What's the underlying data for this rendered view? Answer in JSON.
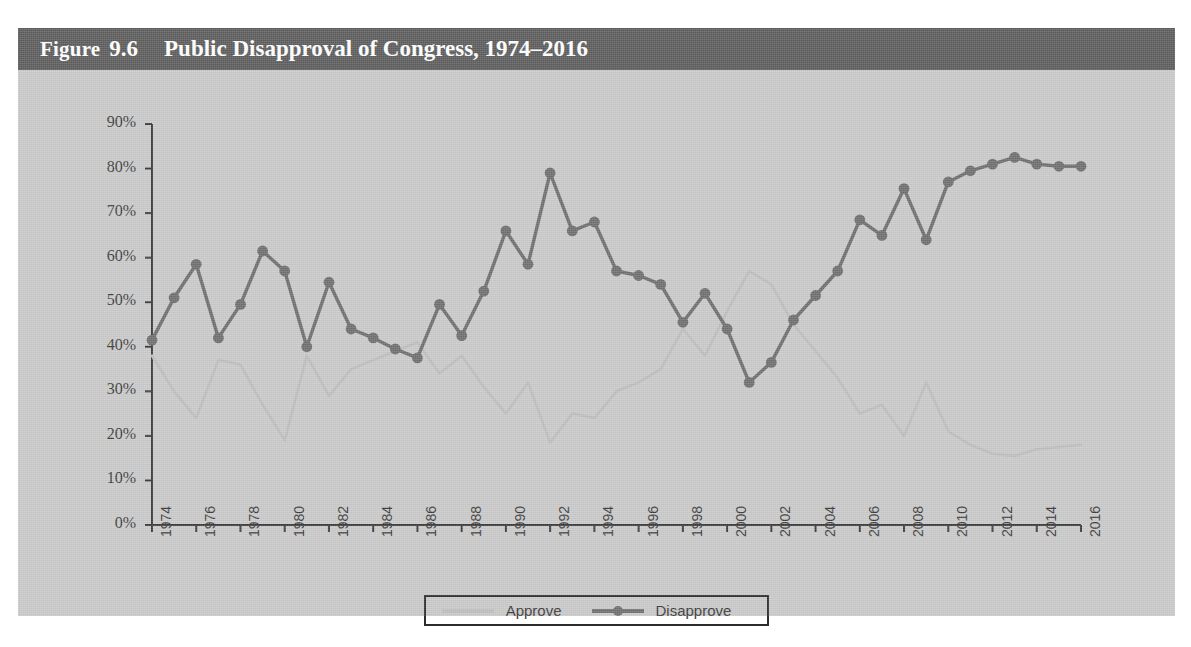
{
  "figure": {
    "label_word": "Figure",
    "number": "9.6",
    "title": "Public Disapproval of Congress, 1974–2016"
  },
  "colors": {
    "title_bar": "#5c5c5c",
    "panel": "#c9c9c9",
    "disapprove": "#6e6e6e",
    "approve": "#bdbdbd",
    "axis": "#3a3a3a",
    "title_text": "#ffffff"
  },
  "legend": {
    "position": "bottom-center",
    "entries": [
      {
        "label": "Approve",
        "marker": "line",
        "color": "#bdbdbd"
      },
      {
        "label": "Disapprove",
        "marker": "line-with-circle",
        "color": "#6e6e6e"
      }
    ]
  },
  "chart_data": {
    "type": "line",
    "title": "Public Disapproval of Congress, 1974–2016",
    "xlabel": "",
    "ylabel": "",
    "ylim": [
      0,
      90
    ],
    "ytick_values": [
      0,
      10,
      20,
      30,
      40,
      50,
      60,
      70,
      80,
      90
    ],
    "ytick_labels": [
      "0%",
      "10%",
      "20%",
      "30%",
      "40%",
      "50%",
      "60%",
      "70%",
      "80%",
      "90%"
    ],
    "xlim": [
      1974,
      2016
    ],
    "xtick_values": [
      1974,
      1976,
      1978,
      1980,
      1982,
      1984,
      1986,
      1988,
      1990,
      1992,
      1994,
      1996,
      1998,
      2000,
      2002,
      2004,
      2006,
      2008,
      2010,
      2012,
      2014,
      2016
    ],
    "xtick_labels": [
      "1974",
      "1976",
      "1978",
      "1980",
      "1982",
      "1984",
      "1986",
      "1988",
      "1990",
      "1992",
      "1994",
      "1996",
      "1998",
      "2000",
      "2002",
      "2004",
      "2006",
      "2008",
      "2010",
      "2012",
      "2014",
      "2016"
    ],
    "grid": false,
    "legend_position": "bottom-center",
    "x": [
      1974,
      1975,
      1976,
      1977,
      1978,
      1979,
      1980,
      1981,
      1982,
      1983,
      1984,
      1985,
      1986,
      1987,
      1988,
      1989,
      1990,
      1991,
      1992,
      1993,
      1994,
      1995,
      1996,
      1997,
      1998,
      1999,
      2000,
      2001,
      2002,
      2003,
      2004,
      2005,
      2006,
      2007,
      2008,
      2009,
      2010,
      2011,
      2012,
      2013,
      2014,
      2015,
      2016
    ],
    "series": [
      {
        "name": "Disapprove",
        "color": "#6e6e6e",
        "marker": "circle",
        "values": [
          41.5,
          51,
          58.5,
          42,
          49.5,
          61.5,
          57,
          40,
          54.5,
          44,
          42,
          39.5,
          37.5,
          49.5,
          42.5,
          52.5,
          66,
          58.5,
          79,
          66,
          68,
          57,
          56,
          54,
          45.5,
          52,
          44,
          32,
          36.5,
          46,
          51.5,
          57,
          68.5,
          65,
          75.5,
          64,
          77,
          79.5,
          81,
          82.5,
          81,
          80.5,
          80.5
        ]
      },
      {
        "name": "Approve",
        "color": "#bdbdbd",
        "marker": "none",
        "values": [
          38,
          30,
          24,
          37,
          36,
          27,
          19,
          38,
          29,
          35,
          37,
          39,
          41,
          34,
          38,
          31,
          25,
          32,
          18.5,
          25,
          24,
          30,
          32,
          35,
          44,
          38,
          48,
          57,
          54,
          45,
          39,
          33,
          25,
          27,
          20,
          32,
          21,
          18,
          16,
          15.5,
          17,
          17.5,
          18
        ]
      }
    ]
  }
}
